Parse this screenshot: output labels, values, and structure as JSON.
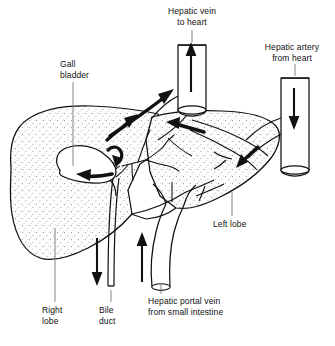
{
  "figure": {
    "background_color": "#ffffff",
    "ink_color": "#111111",
    "stipple_color": "#9a9a9a"
  },
  "labels": {
    "hepatic_vein": "Hepatic vein\nto heart",
    "hepatic_artery": "Hepatic artery\nfrom heart",
    "gall_bladder": "Gall\nbladder",
    "left_lobe": "Left lobe",
    "right_lobe": "Right\nlobe",
    "bile_duct": "Bile\nduct",
    "portal_vein": "Hepatic portal vein\nfrom small intestine"
  },
  "structures": [
    {
      "name": "right-lobe",
      "kind": "organ-lobe",
      "texture": "stipple"
    },
    {
      "name": "left-lobe",
      "kind": "organ-lobe",
      "texture": "stipple"
    },
    {
      "name": "gall-bladder",
      "kind": "organ",
      "texture": "plain"
    },
    {
      "name": "hepatic-vein-tube",
      "kind": "vessel",
      "direction": "out-to-heart"
    },
    {
      "name": "hepatic-artery-tube",
      "kind": "vessel",
      "direction": "in-from-heart"
    },
    {
      "name": "hepatic-portal-vein-tube",
      "kind": "vessel",
      "direction": "in-from-intestine"
    },
    {
      "name": "bile-duct-tube",
      "kind": "duct",
      "direction": "out-downward"
    }
  ],
  "flow_arrows": [
    {
      "name": "arrow-hepatic-vein-out",
      "direction": "up"
    },
    {
      "name": "arrow-hepatic-vein-ascend",
      "direction": "up-right"
    },
    {
      "name": "arrow-hepatic-vein-branch",
      "direction": "up-right"
    },
    {
      "name": "arrow-hepatic-vein-left-lobe",
      "direction": "left"
    },
    {
      "name": "arrow-hepatic-artery-in",
      "direction": "down"
    },
    {
      "name": "arrow-hepatic-artery-into-liver",
      "direction": "down-left"
    },
    {
      "name": "arrow-portal-vein-in",
      "direction": "up"
    },
    {
      "name": "arrow-bile-duct-out",
      "direction": "down"
    },
    {
      "name": "arrow-bile-into-gall-bladder",
      "direction": "left"
    }
  ]
}
